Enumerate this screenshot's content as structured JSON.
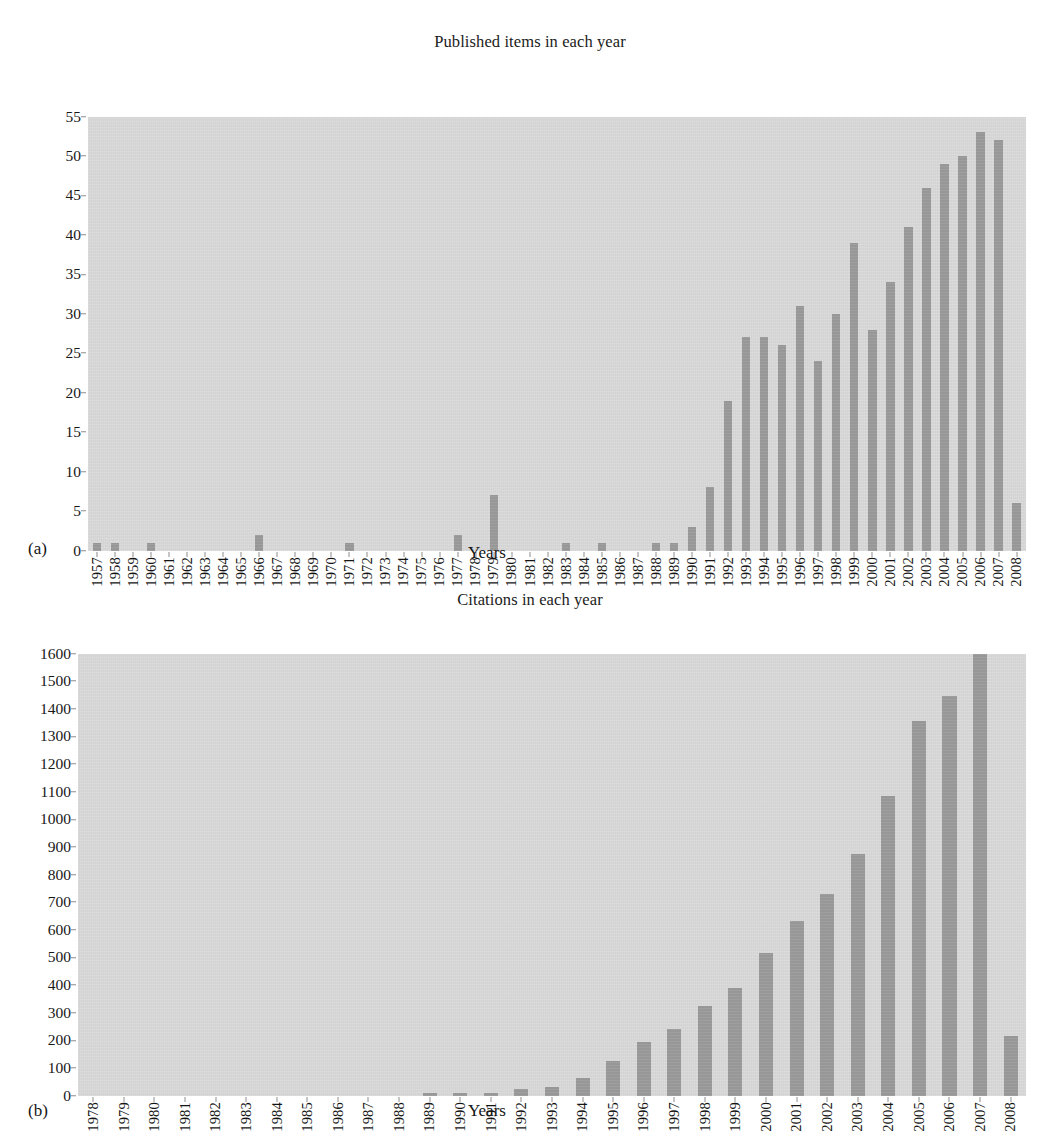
{
  "figures": [
    {
      "letter": "(a)",
      "title": "Published items in each year",
      "xlabel": "Years"
    },
    {
      "letter": "(b)",
      "title": "Citations in each year",
      "xlabel": "Years"
    }
  ],
  "colors": {
    "bar": "#9a9a9a",
    "panel": "#d8d8d8",
    "text": "#151515"
  },
  "chart_data": [
    {
      "type": "bar",
      "title": "Published items in each year",
      "xlabel": "Years",
      "ylabel": "",
      "ylim": [
        0,
        55
      ],
      "yticks": [
        0,
        5,
        10,
        15,
        20,
        25,
        30,
        35,
        40,
        45,
        50,
        55
      ],
      "grid": false,
      "legend": null,
      "annotation": "(a)",
      "categories": [
        "1957",
        "1958",
        "1959",
        "1960",
        "1961",
        "1962",
        "1963",
        "1964",
        "1965",
        "1966",
        "1967",
        "1968",
        "1969",
        "1970",
        "1971",
        "1972",
        "1973",
        "1974",
        "1975",
        "1976",
        "1977",
        "1978",
        "1979",
        "1980",
        "1981",
        "1982",
        "1983",
        "1984",
        "1985",
        "1986",
        "1987",
        "1988",
        "1989",
        "1990",
        "1991",
        "1992",
        "1993",
        "1994",
        "1995",
        "1996",
        "1997",
        "1998",
        "1999",
        "2000",
        "2001",
        "2002",
        "2003",
        "2004",
        "2005",
        "2006",
        "2007",
        "2008"
      ],
      "values": [
        1,
        1,
        0,
        1,
        0,
        0,
        0,
        0,
        0,
        2,
        0,
        0,
        0,
        0,
        1,
        0,
        0,
        0,
        0,
        0,
        2,
        0,
        7,
        0,
        0,
        0,
        1,
        0,
        1,
        0,
        0,
        1,
        1,
        3,
        8,
        19,
        27,
        27,
        26,
        31,
        24,
        30,
        39,
        28,
        34,
        41,
        46,
        49,
        50,
        53,
        52,
        6
      ]
    },
    {
      "type": "bar",
      "title": "Citations in each year",
      "xlabel": "Years",
      "ylabel": "",
      "ylim": [
        0,
        1600
      ],
      "yticks": [
        0,
        100,
        200,
        300,
        400,
        500,
        600,
        700,
        800,
        900,
        1000,
        1100,
        1200,
        1300,
        1400,
        1500,
        1600
      ],
      "grid": false,
      "legend": null,
      "annotation": "(b)",
      "categories": [
        "1978",
        "1979",
        "1980",
        "1981",
        "1982",
        "1983",
        "1984",
        "1985",
        "1986",
        "1987",
        "1988",
        "1989",
        "1990",
        "1991",
        "1992",
        "1993",
        "1994",
        "1995",
        "1996",
        "1997",
        "1998",
        "1999",
        "2000",
        "2001",
        "2002",
        "2003",
        "2004",
        "2005",
        "2006",
        "2007",
        "2008"
      ],
      "values": [
        0,
        0,
        0,
        0,
        0,
        0,
        0,
        0,
        0,
        0,
        0,
        6,
        10,
        10,
        25,
        30,
        65,
        125,
        195,
        240,
        325,
        390,
        515,
        630,
        730,
        875,
        1085,
        1355,
        1445,
        1605,
        215
      ]
    }
  ]
}
